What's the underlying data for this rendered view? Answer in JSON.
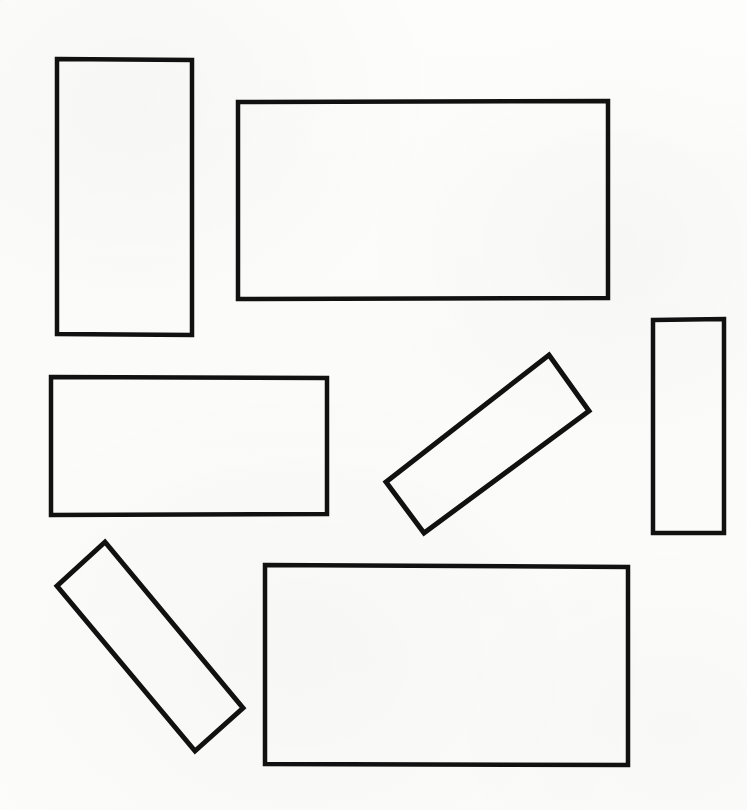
{
  "figure": {
    "canvas": {
      "width": 747,
      "height": 810
    },
    "background_color": "#fdfdfb",
    "stroke_color": "#111111",
    "shape_count": "7",
    "shapes": [
      {
        "id": "rect-tall-upper-left",
        "label": "Tall upright rectangle, upper left",
        "kind": "rectangle",
        "rotation_deg": 0,
        "stroke_width": 4.5,
        "points": "57,59 192,60 192,335 57,334"
      },
      {
        "id": "rect-wide-upper-right",
        "label": "Large wide rectangle, upper right",
        "kind": "rectangle",
        "rotation_deg": 0,
        "stroke_width": 4.5,
        "points": "238,102 608,101 608,298 238,299"
      },
      {
        "id": "rect-wide-middle-left",
        "label": "Wide rectangle, middle left",
        "kind": "rectangle",
        "rotation_deg": 0,
        "stroke_width": 4.5,
        "points": "51,377 327,378 327,514 51,515"
      },
      {
        "id": "rect-tilted-middle-right",
        "label": "Tilted narrow rectangle, middle right",
        "kind": "rectangle",
        "rotation_deg": -55,
        "stroke_width": 5,
        "points": "549,355 589,411 424,533 386,482"
      },
      {
        "id": "rect-tall-right-edge",
        "label": "Narrow tall rectangle, right edge",
        "kind": "rectangle",
        "rotation_deg": 0,
        "stroke_width": 4.5,
        "points": "653,320 724,319 724,533 653,533"
      },
      {
        "id": "rect-tilted-bottom-left",
        "label": "Tilted narrow rectangle, bottom left",
        "kind": "rectangle",
        "rotation_deg": 50,
        "stroke_width": 5,
        "points": "105,542 243,708 195,751 57,586"
      },
      {
        "id": "rect-wide-bottom-right",
        "label": "Large wide rectangle, bottom right",
        "kind": "rectangle",
        "rotation_deg": 0,
        "stroke_width": 4.5,
        "points": "265,565 628,567 628,765 265,764"
      }
    ]
  }
}
